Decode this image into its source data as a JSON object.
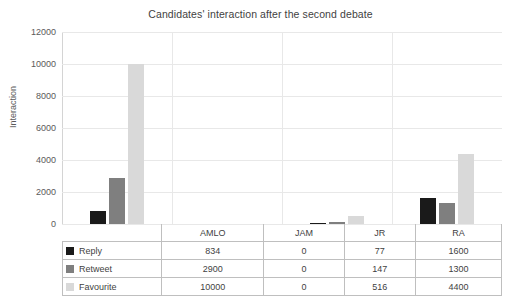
{
  "chart_data": {
    "type": "bar",
    "title": "Candidates' interaction after the second debate",
    "xlabel": "",
    "ylabel": "Interaction",
    "categories": [
      "AMLO",
      "JAM",
      "JR",
      "RA"
    ],
    "series": [
      {
        "name": "Reply",
        "values": [
          834,
          0,
          77,
          1600
        ],
        "color": "#1a1a1a"
      },
      {
        "name": "Retweet",
        "values": [
          2900,
          0,
          147,
          1300
        ],
        "color": "#7f7f7f"
      },
      {
        "name": "Favourite",
        "values": [
          10000,
          0,
          516,
          4400
        ],
        "color": "#d9d9d9"
      }
    ],
    "ylim": [
      0,
      12000
    ],
    "yticks": [
      0,
      2000,
      4000,
      6000,
      8000,
      10000,
      12000
    ],
    "ytick_labels": [
      "0",
      "2000",
      "4000",
      "6000",
      "8000",
      "10000",
      "12000"
    ],
    "grid": true,
    "legend": "data-table-row-labels"
  }
}
